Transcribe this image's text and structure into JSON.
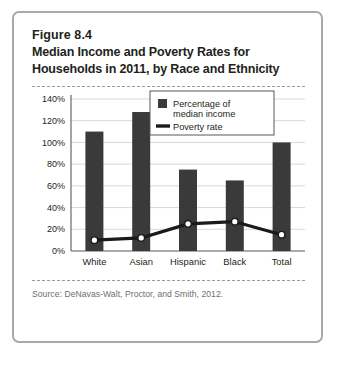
{
  "figure": {
    "number": "Figure 8.4",
    "title_line1": "Median Income and Poverty Rates for",
    "title_line2": "Households in 2011, by Race and Ethnicity",
    "source": "Source: DeNavas-Walt, Proctor, and Smith, 2012."
  },
  "colors": {
    "bar": "#3a3a3a",
    "line": "#1a1a1a",
    "marker_fill": "#ffffff",
    "grid": "#d9d9d9",
    "axis": "#58595b",
    "frame": "#a7a9ac",
    "rule": "#9b9b9b",
    "text": "#231f20",
    "source_text": "#6d6e71"
  },
  "chart_data": {
    "type": "bar",
    "title": "Median Income and Poverty Rates for Households in 2011, by Race and Ethnicity",
    "xlabel": "",
    "ylabel": "",
    "ylim": [
      0,
      140
    ],
    "ytick_step": 20,
    "ytick_labels": [
      "0%",
      "20%",
      "40%",
      "60%",
      "80%",
      "100%",
      "120%",
      "140%"
    ],
    "ytick_values": [
      0,
      20,
      40,
      60,
      80,
      100,
      120,
      140
    ],
    "grid": true,
    "legend_position": "upper-center",
    "categories": [
      "White",
      "Asian",
      "Hispanic",
      "Black",
      "Total"
    ],
    "series": [
      {
        "name": "Percentage of median income",
        "type": "bar",
        "values": [
          110,
          128,
          75,
          65,
          100
        ]
      },
      {
        "name": "Poverty rate",
        "type": "line",
        "values": [
          10,
          12,
          25,
          27,
          15
        ]
      }
    ]
  },
  "legend": {
    "items": [
      {
        "label_line1": "Percentage of",
        "label_line2": "median income",
        "marker": "bar-swatch"
      },
      {
        "label_line1": "Poverty rate",
        "label_line2": "",
        "marker": "line-swatch"
      }
    ]
  }
}
